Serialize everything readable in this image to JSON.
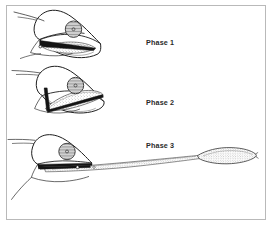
{
  "figure": {
    "kind": "scientific-line-drawing",
    "border_color": "#b9b9b9",
    "background_color": "#ffffff",
    "ink_color": "#1a1a1a",
    "stipple_color": "#5a5a5a",
    "panels": [
      {
        "id": "phase-1",
        "label": "Phase 1",
        "description": "head with mouth open, tongue still retracted inside the gaping jaws"
      },
      {
        "id": "phase-2",
        "label": "Phase 2",
        "description": "hyoid apparatus swung forward, tongue beginning to launch from the mouth"
      },
      {
        "id": "phase-3",
        "label": "Phase 3",
        "description": "tongue fully projected with bulbous adhesive pad at the far tip"
      }
    ]
  }
}
